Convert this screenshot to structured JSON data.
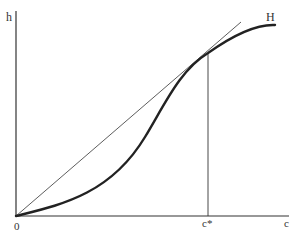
{
  "diagram": {
    "y_axis_label": "h",
    "x_axis_label": "c",
    "origin_label": "0",
    "curve_label": "H",
    "tangent_point_label": "c*",
    "colors": {
      "ink": "#333333",
      "background": "#ffffff"
    }
  }
}
